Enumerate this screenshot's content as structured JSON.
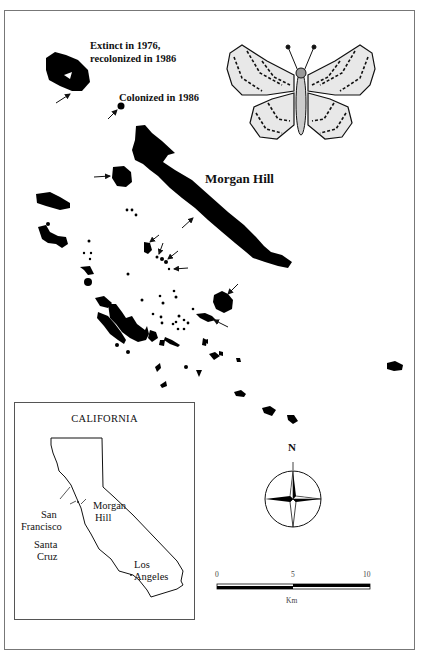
{
  "annotations": {
    "extinct_line1": "Extinct in 1976,",
    "extinct_line2": "recolonized in 1986",
    "colonized": "Colonized in 1986",
    "main_location": "Morgan Hill"
  },
  "inset_map": {
    "title": "CALIFORNIA",
    "labels": {
      "san": "San",
      "francisco": "Francisco",
      "santa": "Santa",
      "cruz": "Cruz",
      "morgan": "Morgan",
      "hill": "Hill",
      "los": "Los",
      "angeles": "Angeles"
    }
  },
  "compass": {
    "north_label": "N"
  },
  "scale_bar": {
    "ticks": [
      "0",
      "5",
      "10"
    ],
    "unit": "Km"
  },
  "colors": {
    "habitat": "#000000",
    "background": "#ffffff",
    "frame": "#777777"
  }
}
